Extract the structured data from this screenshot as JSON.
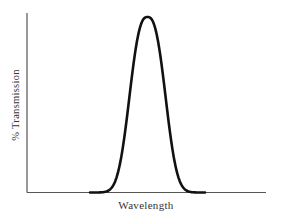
{
  "chart_data": {
    "type": "line",
    "title": "",
    "xlabel": "Wavelength",
    "ylabel": "% Transmission",
    "grid": false,
    "legend": null,
    "x_ticks": [],
    "y_ticks": [],
    "series": [
      {
        "name": "transmission",
        "x": [
          0,
          0.3,
          0.35,
          0.4,
          0.42,
          0.45,
          0.48,
          0.5,
          0.52,
          0.55,
          0.58,
          0.6,
          0.65,
          0.7,
          1.0
        ],
        "y": [
          0,
          0,
          1,
          8,
          25,
          60,
          92,
          100,
          92,
          60,
          25,
          8,
          1,
          0,
          0
        ]
      }
    ],
    "xlim": [
      0,
      1
    ],
    "ylim": [
      0,
      100
    ],
    "colors": {
      "line": "#111111",
      "axis": "#444444"
    }
  }
}
